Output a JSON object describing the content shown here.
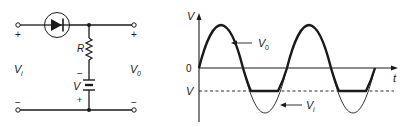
{
  "circuit": {
    "input_label": "V",
    "input_sub": "i",
    "output_label": "V",
    "output_sub": "0",
    "resistor_label": "R",
    "battery_label": "V",
    "battery_minus": "−",
    "battery_plus": "+",
    "input_plus": "+",
    "input_minus": "−",
    "output_plus": "+",
    "output_minus": "−"
  },
  "graph": {
    "y_axis_label": "V",
    "x_axis_label": "t",
    "zero_label": "0",
    "clip_level_label": "V",
    "output_curve_label": "V",
    "output_curve_sub": "0",
    "input_curve_label": "V",
    "input_curve_sub": "i"
  },
  "colors": {
    "ink": "#1a1a1a",
    "background": "#ffffff"
  }
}
